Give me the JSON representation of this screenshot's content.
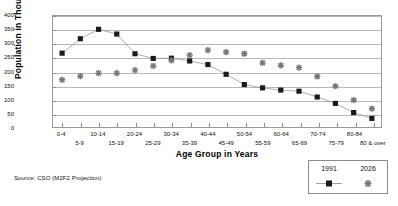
{
  "chart_data": {
    "type": "line",
    "title": "",
    "xlabel": "Age Group in Years",
    "ylabel": "Population in Thousands",
    "ylim": [
      0,
      400
    ],
    "yticks": [
      0,
      50,
      100,
      150,
      200,
      250,
      300,
      350,
      400
    ],
    "grid": true,
    "legend_position": "bottom-right",
    "categories": [
      "0-4",
      "5-9",
      "10-14",
      "15-19",
      "20-24",
      "25-29",
      "30-34",
      "35-39",
      "40-44",
      "45-49",
      "50-54",
      "55-59",
      "60-64",
      "65-69",
      "70-74",
      "75-79",
      "80-84",
      "80 & over"
    ],
    "series": [
      {
        "name": "1991",
        "marker": "square",
        "color": "#1a1a1a",
        "line": true,
        "values": [
          266,
          318,
          352,
          335,
          264,
          247,
          248,
          238,
          225,
          190,
          153,
          141,
          133,
          129,
          108,
          85,
          52,
          31
        ]
      },
      {
        "name": "2026",
        "marker": "asterisk",
        "color": "#777777",
        "line": false,
        "values": [
          170,
          183,
          194,
          194,
          205,
          220,
          240,
          259,
          277,
          270,
          264,
          231,
          222,
          214,
          182,
          147,
          97,
          66
        ]
      }
    ],
    "source_note": "Source: CSO (M2F2 Projection)"
  },
  "legend": {
    "entries": [
      {
        "label": "1991",
        "marker": "square-with-line"
      },
      {
        "label": "2026",
        "marker": "asterisk"
      }
    ]
  }
}
